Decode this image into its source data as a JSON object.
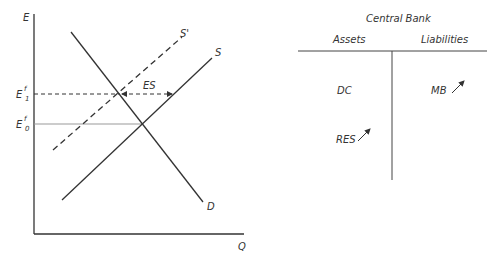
{
  "graph": {
    "y_axis_label": "E",
    "x_axis_label": "Q",
    "e1_label": "E",
    "e1_sup": "f",
    "e1_sub": "1",
    "e0_label": "E",
    "e0_sup": "f",
    "e0_sub": "0",
    "supply_label": "S",
    "supply_shift_label": "S'",
    "demand_label": "D",
    "excess_supply_label": "ES"
  },
  "t_account": {
    "title": "Central Bank",
    "assets_header": "Assets",
    "liabilities_header": "Liabilities",
    "assets": [
      {
        "label": "DC",
        "change": ""
      },
      {
        "label": "RES",
        "change": "up-arrow"
      }
    ],
    "liabilities": [
      {
        "label": "MB",
        "change": "up-arrow"
      }
    ]
  },
  "colors": {
    "line": "#333333",
    "guide": "#999999"
  }
}
